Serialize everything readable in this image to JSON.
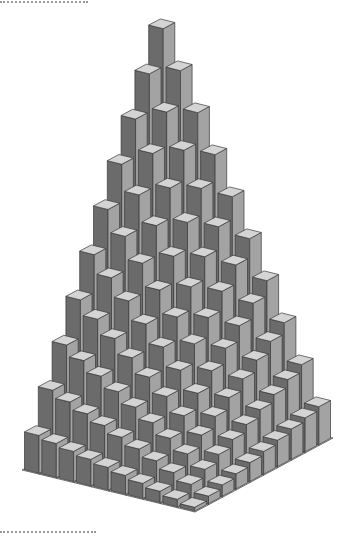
{
  "chart_data": {
    "type": "bar3d",
    "title": "",
    "xlabel": "",
    "ylabel": "",
    "zlabel": "",
    "grid": true,
    "legend": null,
    "x_categories": [
      1,
      2,
      3,
      4,
      5,
      6,
      7,
      8,
      9,
      10
    ],
    "y_categories": [
      1,
      2,
      3,
      4,
      5,
      6,
      7,
      8,
      9,
      10
    ],
    "zlim": [
      0,
      10
    ],
    "values": [
      [
        10.0,
        9.0,
        8.0,
        7.0,
        6.0,
        5.0,
        4.0,
        3.0,
        2.0,
        1.0
      ],
      [
        9.0,
        8.1,
        7.2,
        6.3,
        5.4,
        4.5,
        3.6,
        2.7,
        1.8,
        0.9
      ],
      [
        8.0,
        7.2,
        6.4,
        5.6,
        4.8,
        4.0,
        3.2,
        2.4,
        1.6,
        0.8
      ],
      [
        7.0,
        6.3,
        5.6,
        4.9,
        4.2,
        3.5,
        2.8,
        2.1,
        1.4,
        0.7
      ],
      [
        6.0,
        5.4,
        4.8,
        4.2,
        3.6,
        3.0,
        2.4,
        1.8,
        1.2,
        0.6
      ],
      [
        5.0,
        4.5,
        4.0,
        3.5,
        3.0,
        2.5,
        2.0,
        1.5,
        1.0,
        0.5
      ],
      [
        4.0,
        3.6,
        3.2,
        2.8,
        2.4,
        2.0,
        1.6,
        1.2,
        0.8,
        0.4
      ],
      [
        3.0,
        2.7,
        2.4,
        2.1,
        1.8,
        1.5,
        1.2,
        0.9,
        0.6,
        0.3
      ],
      [
        2.0,
        1.8,
        1.6,
        1.4,
        1.2,
        1.0,
        0.8,
        0.6,
        0.4,
        0.2
      ],
      [
        1.0,
        0.9,
        0.8,
        0.7,
        0.6,
        0.5,
        0.4,
        0.3,
        0.2,
        0.1
      ]
    ]
  },
  "style": {
    "front_face_color": "#6b6b6b",
    "side_face_color": "#a3a3a3",
    "top_face_color": "#d4d4d4",
    "grid_tile_color": "#e0e0e0",
    "edge_color": "#3a3a3a",
    "background": "#ffffff"
  }
}
